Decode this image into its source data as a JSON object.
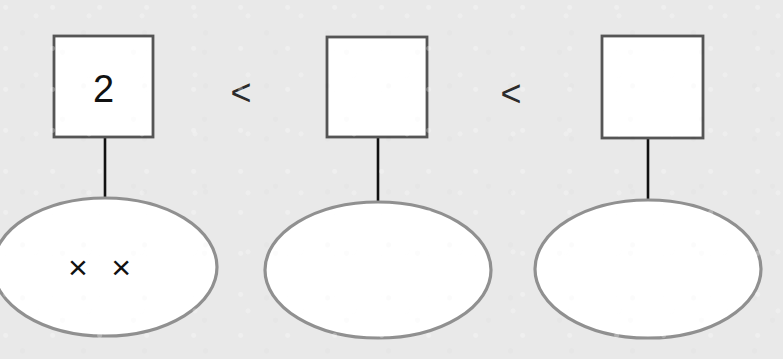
{
  "page": {
    "background_color": "#e9e9e9",
    "width": 783,
    "height": 359
  },
  "style": {
    "square_fill": "#ffffff",
    "square_stroke": "#555555",
    "ellipse_fill": "#ffffff",
    "ellipse_stroke": "#909090",
    "connector_color": "#111111",
    "text_color": "#111111",
    "operator_color": "#2b2b2b"
  },
  "groups": [
    {
      "id": "group-1",
      "square_label": "2",
      "ellipse_label": "× ×",
      "tally_count": 2,
      "square": {
        "x": 54,
        "y": 36,
        "w": 99,
        "h": 101
      },
      "ellipse": {
        "cx": 105,
        "cy": 267,
        "rx": 112,
        "ry": 69
      },
      "connector": {
        "x": 105,
        "y1": 137,
        "y2": 199
      }
    },
    {
      "id": "group-2",
      "square_label": "",
      "ellipse_label": "",
      "tally_count": 0,
      "square": {
        "x": 327,
        "y": 37,
        "w": 100,
        "h": 100
      },
      "ellipse": {
        "cx": 378,
        "cy": 270,
        "rx": 113,
        "ry": 68
      },
      "connector": {
        "x": 378,
        "y1": 137,
        "y2": 202
      }
    },
    {
      "id": "group-3",
      "square_label": "",
      "ellipse_label": "",
      "tally_count": 0,
      "square": {
        "x": 602,
        "y": 36,
        "w": 101,
        "h": 102
      },
      "ellipse": {
        "cx": 648,
        "cy": 269,
        "rx": 113,
        "ry": 69
      },
      "connector": {
        "x": 648,
        "y1": 138,
        "y2": 200
      }
    }
  ],
  "operators": [
    {
      "id": "operator-1",
      "symbol": "<",
      "x": 241,
      "y": 92
    },
    {
      "id": "operator-2",
      "symbol": "<",
      "x": 511,
      "y": 93
    }
  ]
}
